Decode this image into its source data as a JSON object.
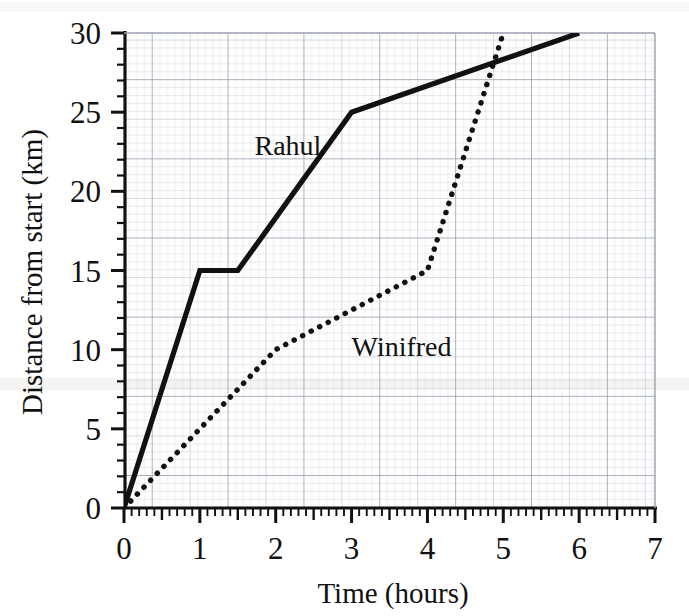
{
  "chart_data": {
    "type": "line",
    "title": "",
    "xlabel": "Time (hours)",
    "ylabel": "Distance from start (km)",
    "xlim": [
      0,
      7
    ],
    "ylim": [
      0,
      30
    ],
    "xticks": [
      0,
      1,
      2,
      3,
      4,
      5,
      6,
      7
    ],
    "xtick_labels": [
      "0",
      "1",
      "2",
      "3",
      "4",
      "5",
      "6",
      "7"
    ],
    "yticks": [
      0,
      5,
      10,
      15,
      20,
      25,
      30
    ],
    "ytick_labels": [
      "0",
      "5",
      "10",
      "15",
      "20",
      "25",
      "30"
    ],
    "x_minor_step": 0.1,
    "y_minor_step": 0.5,
    "grid": true,
    "legend_position": "inline-annotation",
    "series": [
      {
        "name": "Rahul",
        "style": "solid",
        "color": "#111111",
        "label_x": 1.72,
        "label_y": 22.3,
        "points": [
          {
            "x": 0,
            "y": 0
          },
          {
            "x": 1,
            "y": 15
          },
          {
            "x": 1.5,
            "y": 15
          },
          {
            "x": 3,
            "y": 25
          },
          {
            "x": 6,
            "y": 30
          }
        ]
      },
      {
        "name": "Winifred",
        "style": "dotted",
        "color": "#111111",
        "label_x": 3.0,
        "label_y": 9.6,
        "points": [
          {
            "x": 0,
            "y": 0
          },
          {
            "x": 2,
            "y": 10
          },
          {
            "x": 4,
            "y": 15
          },
          {
            "x": 5,
            "y": 30
          }
        ]
      }
    ],
    "annotations": [
      {
        "text": "Rahul",
        "x": 1.72,
        "y": 22.3
      },
      {
        "text": "Winifred",
        "x": 3.0,
        "y": 9.6
      }
    ]
  },
  "labels": {
    "x_axis_title": "Time (hours)",
    "y_axis_title": "Distance from start (km)",
    "series_rahul": "Rahul",
    "series_winifred": "Winifred",
    "x0": "0",
    "x1": "1",
    "x2": "2",
    "x3": "3",
    "x4": "4",
    "x5": "5",
    "x6": "6",
    "x7": "7",
    "y0": "0",
    "y5": "5",
    "y10": "10",
    "y15": "15",
    "y20": "20",
    "y25": "25",
    "y30": "30"
  },
  "colors": {
    "ink": "#111111",
    "grid_minor": "#cfd3dc",
    "grid_major": "#9aa0ad",
    "background": "#ffffff"
  }
}
